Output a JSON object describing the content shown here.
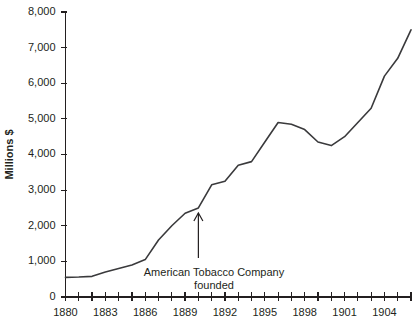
{
  "chart_data": {
    "type": "line",
    "title": "",
    "xlabel": "",
    "ylabel": "Millions $",
    "xlim": [
      1880,
      1906
    ],
    "ylim": [
      0,
      8000
    ],
    "grid": false,
    "legend": null,
    "y_ticks": [
      0,
      1000,
      2000,
      3000,
      4000,
      5000,
      6000,
      7000,
      8000
    ],
    "y_tick_labels": [
      "0",
      "1,000",
      "2,000",
      "3,000",
      "4,000",
      "5,000",
      "6,000",
      "7,000",
      "8,000"
    ],
    "x_ticks": [
      1880,
      1881,
      1882,
      1883,
      1884,
      1885,
      1886,
      1887,
      1888,
      1889,
      1890,
      1891,
      1892,
      1893,
      1894,
      1895,
      1896,
      1897,
      1898,
      1899,
      1900,
      1901,
      1902,
      1903,
      1904,
      1905,
      1906
    ],
    "x_tick_labels": [
      "1880",
      "",
      "",
      "1883",
      "",
      "",
      "1886",
      "",
      "",
      "1889",
      "",
      "",
      "1892",
      "",
      "",
      "1895",
      "",
      "",
      "1898",
      "",
      "",
      "1901",
      "",
      "",
      "1904",
      "",
      ""
    ],
    "x": [
      1880,
      1881,
      1882,
      1883,
      1884,
      1885,
      1886,
      1887,
      1888,
      1889,
      1890,
      1891,
      1892,
      1893,
      1894,
      1895,
      1896,
      1897,
      1898,
      1899,
      1900,
      1901,
      1902,
      1903,
      1904,
      1905,
      1906
    ],
    "values": [
      550,
      560,
      580,
      700,
      800,
      900,
      1050,
      1600,
      2000,
      2350,
      2500,
      3150,
      3250,
      3700,
      3800,
      4350,
      4900,
      4850,
      4700,
      4350,
      4250,
      4500,
      4900,
      5300,
      6200,
      6700,
      7500
    ],
    "annotations": [
      {
        "text_line1": "American Tobacco Company",
        "text_line2": "founded",
        "target_x": 1890,
        "target_y": 2500
      }
    ],
    "line_color": "#3a3a3c",
    "axis_color": "#231f20"
  }
}
